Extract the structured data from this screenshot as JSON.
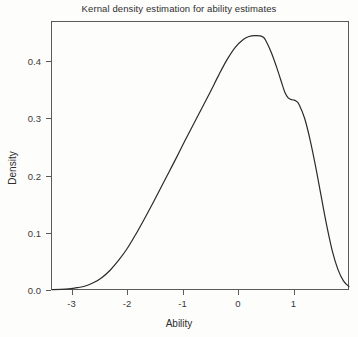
{
  "chart_data": {
    "type": "line",
    "title": "Kernal density estimation for ability estimates",
    "xlabel": "Ability",
    "ylabel": "Density",
    "xlim": [
      -3.37,
      2.0
    ],
    "ylim": [
      0.0,
      0.47
    ],
    "grid": false,
    "legend": null,
    "xticks": [
      -3,
      -2,
      -1,
      0,
      1
    ],
    "xtick_labels": [
      "-3",
      "-2",
      "-1",
      "0",
      "1"
    ],
    "yticks": [
      0.0,
      0.1,
      0.2,
      0.3,
      0.4
    ],
    "ytick_labels": [
      "0.0",
      "0.1",
      "0.2",
      "0.3",
      "0.4"
    ],
    "line_color": "#2b2b2b",
    "line_width": 1.2,
    "series": [
      {
        "name": "density",
        "x": [
          -3.35,
          -3.2,
          -3.05,
          -2.9,
          -2.75,
          -2.6,
          -2.45,
          -2.3,
          -2.15,
          -2.0,
          -1.85,
          -1.7,
          -1.55,
          -1.4,
          -1.25,
          -1.1,
          -0.95,
          -0.8,
          -0.65,
          -0.5,
          -0.35,
          -0.2,
          -0.05,
          0.1,
          0.2,
          0.3,
          0.4,
          0.45,
          0.5,
          0.6,
          0.7,
          0.8,
          0.85,
          0.9,
          0.95,
          1.0,
          1.05,
          1.1,
          1.2,
          1.3,
          1.4,
          1.5,
          1.6,
          1.7,
          1.8,
          1.9,
          2.0
        ],
        "y": [
          0.0005,
          0.001,
          0.002,
          0.004,
          0.007,
          0.013,
          0.022,
          0.035,
          0.052,
          0.072,
          0.096,
          0.122,
          0.149,
          0.177,
          0.205,
          0.233,
          0.262,
          0.29,
          0.318,
          0.346,
          0.375,
          0.402,
          0.424,
          0.438,
          0.443,
          0.4445,
          0.444,
          0.442,
          0.436,
          0.415,
          0.388,
          0.358,
          0.344,
          0.336,
          0.333,
          0.332,
          0.33,
          0.324,
          0.3,
          0.262,
          0.215,
          0.163,
          0.112,
          0.068,
          0.036,
          0.016,
          0.006
        ]
      }
    ]
  },
  "plot_geometry": {
    "left": 51,
    "right": 349,
    "top": 21,
    "bottom": 290
  }
}
